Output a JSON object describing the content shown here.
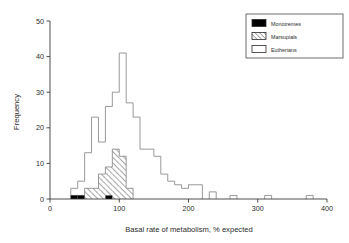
{
  "figure": {
    "background": "#ffffff",
    "line_color": "#888888",
    "axis_color": "#3a3a3a"
  },
  "axes": {
    "x_title": "Basal rate of metabolism, % expected",
    "y_title": "Frequency",
    "x_ticks": [
      "0",
      "100",
      "200",
      "300",
      "400"
    ],
    "y_ticks": [
      "0",
      "10",
      "20",
      "30",
      "40",
      "50"
    ]
  },
  "legend": {
    "items": [
      {
        "label": "Monotremes",
        "pattern": "solid-black",
        "color": "#000000"
      },
      {
        "label": "Marsupials",
        "pattern": "diagonal-hatch",
        "color": "#ffffff"
      },
      {
        "label": "Eutherians",
        "pattern": "open-white",
        "color": "#ffffff"
      }
    ]
  },
  "chart_data": {
    "type": "bar",
    "title": "",
    "xlabel": "Basal rate of metabolism, % expected",
    "ylabel": "Frequency",
    "xlim": [
      0,
      400
    ],
    "ylim": [
      0,
      50
    ],
    "xticks": [
      0,
      100,
      200,
      300,
      400
    ],
    "yticks": [
      0,
      10,
      20,
      30,
      40,
      50
    ],
    "grid": false,
    "legend_position": "top-right",
    "bin_width": 10,
    "bin_starts": [
      20,
      30,
      40,
      50,
      60,
      70,
      80,
      90,
      100,
      110,
      120,
      130,
      140,
      150,
      160,
      170,
      180,
      190,
      200,
      210,
      220,
      230,
      240,
      250,
      260,
      270,
      280,
      290,
      300,
      310,
      320,
      330,
      340,
      350,
      360,
      370
    ],
    "series": [
      {
        "name": "Eutherians",
        "pattern": "open-white",
        "values": [
          0,
          3,
          5,
          13,
          23,
          16,
          26,
          30,
          41,
          27,
          23,
          14,
          14,
          12,
          7,
          5,
          4,
          3,
          4,
          4,
          0,
          2,
          0,
          0,
          1,
          0,
          0,
          0,
          0,
          1,
          0,
          0,
          0,
          0,
          0,
          1
        ]
      },
      {
        "name": "Marsupials",
        "pattern": "diagonal-hatch",
        "values": [
          0,
          1,
          1,
          3,
          3,
          7,
          9,
          14,
          12,
          3,
          0,
          0,
          0,
          0,
          0,
          0,
          0,
          0,
          0,
          0,
          0,
          0,
          0,
          0,
          0,
          0,
          0,
          0,
          0,
          0,
          0,
          0,
          0,
          0,
          0,
          0
        ]
      },
      {
        "name": "Monotremes",
        "pattern": "solid-black",
        "values": [
          0,
          1,
          1,
          0,
          0,
          0,
          1,
          0,
          0,
          0,
          0,
          0,
          0,
          0,
          0,
          0,
          0,
          0,
          0,
          0,
          0,
          0,
          0,
          0,
          0,
          0,
          0,
          0,
          0,
          0,
          0,
          0,
          0,
          0,
          0,
          0
        ]
      }
    ]
  }
}
